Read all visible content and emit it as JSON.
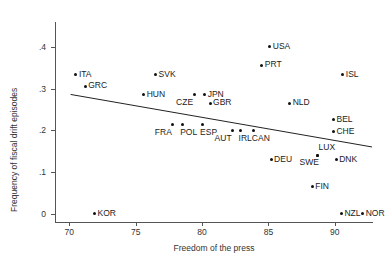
{
  "chart_data": {
    "type": "scatter",
    "title": "",
    "xlabel": "Freedom of the press",
    "ylabel": "Frequency of fiscal drift episodes",
    "xlim": [
      69.0,
      92.8
    ],
    "ylim": [
      -0.02,
      0.455
    ],
    "xticks": [
      70,
      75,
      80,
      85,
      90
    ],
    "xtick_labels": [
      "70",
      "75",
      "80",
      "85",
      "90"
    ],
    "yticks": [
      0,
      0.1,
      0.2,
      0.3,
      0.4
    ],
    "ytick_labels": [
      "0",
      ".1",
      ".2",
      ".3",
      ".4"
    ],
    "grid": false,
    "legend": null,
    "points": [
      {
        "label": "ITA",
        "x": 70.5,
        "y": 0.333,
        "label_pos": "right"
      },
      {
        "label": "GRC",
        "x": 71.2,
        "y": 0.306,
        "label_pos": "right"
      },
      {
        "label": "KOR",
        "x": 71.9,
        "y": 0.0,
        "label_pos": "right"
      },
      {
        "label": "HUN",
        "x": 75.6,
        "y": 0.285,
        "label_pos": "right"
      },
      {
        "label": "SVK",
        "x": 76.5,
        "y": 0.333,
        "label_pos": "right"
      },
      {
        "label": "FRA",
        "x": 77.8,
        "y": 0.213,
        "label_pos": "below-left"
      },
      {
        "label": "POL",
        "x": 78.5,
        "y": 0.213,
        "label_pos": "below-right"
      },
      {
        "label": "CZE",
        "x": 79.4,
        "y": 0.285,
        "label_pos": "below-left"
      },
      {
        "label": "ESP",
        "x": 80.0,
        "y": 0.213,
        "label_pos": "below-right"
      },
      {
        "label": "JPN",
        "x": 80.2,
        "y": 0.285,
        "label_pos": "right"
      },
      {
        "label": "GBR",
        "x": 80.6,
        "y": 0.265,
        "label_pos": "right"
      },
      {
        "label": "AUT",
        "x": 82.3,
        "y": 0.199,
        "label_pos": "below-left"
      },
      {
        "label": "IRL",
        "x": 82.9,
        "y": 0.199,
        "label_pos": "below-right"
      },
      {
        "label": "CAN",
        "x": 83.9,
        "y": 0.199,
        "label_pos": "below-right"
      },
      {
        "label": "PRT",
        "x": 84.5,
        "y": 0.356,
        "label_pos": "right"
      },
      {
        "label": "USA",
        "x": 85.1,
        "y": 0.4,
        "label_pos": "right"
      },
      {
        "label": "DEU",
        "x": 85.2,
        "y": 0.129,
        "label_pos": "right"
      },
      {
        "label": "NLD",
        "x": 86.6,
        "y": 0.265,
        "label_pos": "right"
      },
      {
        "label": "FIN",
        "x": 88.3,
        "y": 0.065,
        "label_pos": "right"
      },
      {
        "label": "SWE",
        "x": 88.7,
        "y": 0.14,
        "label_pos": "below-left"
      },
      {
        "label": "LUX",
        "x": 88.7,
        "y": 0.14,
        "label_pos": "above-right"
      },
      {
        "label": "CHE",
        "x": 89.9,
        "y": 0.196,
        "label_pos": "right"
      },
      {
        "label": "BEL",
        "x": 89.9,
        "y": 0.225,
        "label_pos": "right"
      },
      {
        "label": "DNK",
        "x": 90.1,
        "y": 0.129,
        "label_pos": "right"
      },
      {
        "label": "ISL",
        "x": 90.6,
        "y": 0.333,
        "label_pos": "right"
      },
      {
        "label": "NZL",
        "x": 90.5,
        "y": 0.0,
        "label_pos": "right"
      },
      {
        "label": "NOR",
        "x": 92.1,
        "y": 0.0,
        "label_pos": "right"
      }
    ],
    "fit_line": {
      "type": "linear-fit",
      "x_start": 70.1,
      "y_start": 0.286,
      "x_end": 92.8,
      "y_end": 0.16
    }
  }
}
